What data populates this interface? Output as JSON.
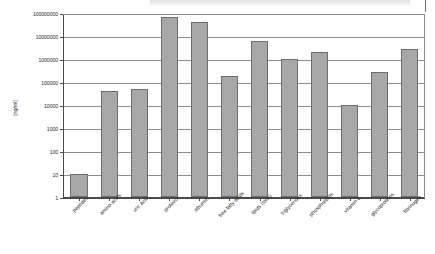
{
  "chart_data": {
    "type": "bar",
    "title": "",
    "xlabel": "",
    "ylabel": "[ng/ml]",
    "yscale": "log",
    "ylim": [
      1,
      100000000
    ],
    "grid": true,
    "legend": "none",
    "ytick_labels": [
      "100000000",
      "10000000",
      "1000000",
      "100000",
      "10000",
      "1000",
      "100",
      "10",
      "1"
    ],
    "ytick_values": [
      100000000,
      10000000,
      1000000,
      100000,
      10000,
      1000,
      100,
      10,
      1
    ],
    "categories": [
      "peptides",
      "amino acids",
      "uric acid",
      "proteins",
      "albumin",
      "free fatty acids",
      "lipids (total)",
      "triglycerides",
      "phospholipids",
      "vitamin E",
      "glycoproteins",
      "fibrinogen"
    ],
    "values": [
      10,
      40000,
      50000,
      70000000,
      42000000,
      180000,
      6000000,
      1000000,
      2000000,
      10000,
      280000,
      2800000
    ],
    "bar_color": "#a8a8a8",
    "bar_edge_color": "#6d6d6d"
  },
  "axis": {
    "y_title": "[ng/ml]"
  }
}
